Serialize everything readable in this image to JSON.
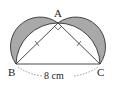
{
  "diagram": {
    "type": "geometry",
    "points": {
      "A": {
        "label": "A"
      },
      "B": {
        "label": "B"
      },
      "C": {
        "label": "C"
      }
    },
    "measurement": {
      "segment": "BC",
      "label": "8 cm"
    },
    "right_angle_at": "A",
    "equal_ticks": [
      "AB",
      "AC"
    ],
    "colors": {
      "shade": "#a9a9a9",
      "stroke": "#333333",
      "background": "#ffffff"
    }
  }
}
